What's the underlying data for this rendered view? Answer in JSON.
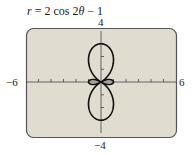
{
  "chart_data": {
    "type": "line",
    "subtype": "polar",
    "title": "r = 2 cos 2θ − 1",
    "equation": {
      "r": "2*cos(2*theta) - 1",
      "theta_range": [
        0,
        6.283185307
      ]
    },
    "xlim": [
      -6,
      6
    ],
    "ylim": [
      -4,
      4
    ],
    "x_tick_step": 1,
    "y_tick_step": 1,
    "axis_labels": {
      "x_min": "−6",
      "x_max": "6",
      "y_min": "−4",
      "y_max": "4"
    },
    "grid": false,
    "legend": null,
    "colors": {
      "background": "#e0dccf",
      "frame": "#555555",
      "curve": "#111111",
      "axis": "#444444"
    },
    "key_points": [
      {
        "theta": "0",
        "r": 1,
        "x": 1,
        "y": 0
      },
      {
        "theta": "π/2",
        "r": -3,
        "x": 0,
        "y": -3
      },
      {
        "theta": "π",
        "r": 1,
        "x": -1,
        "y": 0
      },
      {
        "theta": "3π/2",
        "r": -3,
        "x": 0,
        "y": 3
      }
    ]
  },
  "title_parts": {
    "lhs": "r",
    "rhs": " = 2 cos 2",
    "var": "θ",
    "tail": " − 1"
  }
}
